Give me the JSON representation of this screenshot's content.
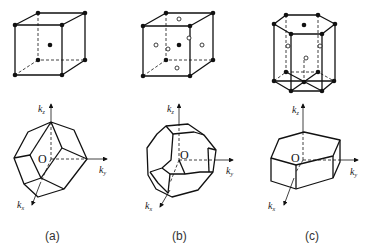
{
  "figure": {
    "panels": [
      {
        "id": "a",
        "caption": "(a)",
        "lattice": "body-centered cubic",
        "zone": "rhombic dodecahedron",
        "axis_labels": {
          "kz": "k",
          "kz_sub": "z",
          "ky": "k",
          "ky_sub": "y",
          "kx": "k",
          "kx_sub": "x"
        },
        "origin_label": "O"
      },
      {
        "id": "b",
        "caption": "(b)",
        "lattice": "face-centered cubic",
        "zone": "truncated octahedron",
        "axis_labels": {
          "kz": "k",
          "kz_sub": "z",
          "ky": "k",
          "ky_sub": "y",
          "kx": "k",
          "kx_sub": "x"
        },
        "origin_label": "O"
      },
      {
        "id": "c",
        "caption": "(c)",
        "lattice": "hexagonal close-packed",
        "zone": "hexagonal prism",
        "axis_labels": {
          "kz": "k",
          "kz_sub": "z",
          "ky": "k",
          "ky_sub": "y",
          "kx": "k",
          "kx_sub": "x"
        },
        "origin_label": "O"
      }
    ]
  },
  "colors": {
    "line": "#111111",
    "background": "#ffffff"
  }
}
